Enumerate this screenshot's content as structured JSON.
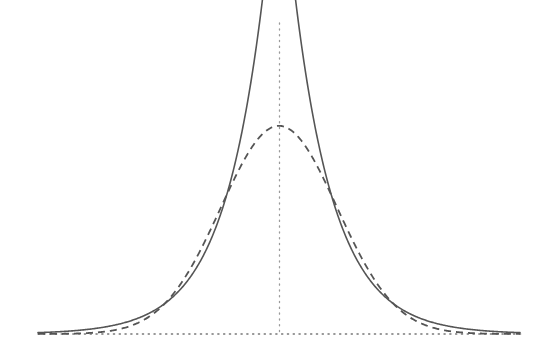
{
  "figure": {
    "title": "",
    "background_color": "#ffffff",
    "width": 554,
    "height": 364
  },
  "chart_data": {
    "type": "line",
    "title": "",
    "subtitle": "",
    "xlabel": "",
    "ylabel": "",
    "xlim": [
      -6,
      6
    ],
    "ylim": [
      0,
      0.58
    ],
    "grid": false,
    "legend_position": "none",
    "annotations": [],
    "axes": {
      "x_axis_style": "dotted",
      "x_axis_color": "#777777",
      "x_axis_y_value": 0,
      "center_line_style": "dotted",
      "center_line_color": "#999999",
      "center_line_x_value": 0,
      "tick_labels_x": [],
      "tick_labels_y": [],
      "ticks_visible": false
    },
    "series": [
      {
        "name": "Laplace density",
        "style": "solid",
        "color": "#555555",
        "line_width": 1.6,
        "peak_x": 0,
        "peak_y": 0.55,
        "scale": 0.9,
        "x": [
          -6.0,
          -5.7,
          -5.4,
          -5.1,
          -4.8,
          -4.5,
          -4.2,
          -3.9,
          -3.6,
          -3.3,
          -3.0,
          -2.7,
          -2.4,
          -2.1,
          -1.8,
          -1.5,
          -1.2,
          -0.9,
          -0.6,
          -0.3,
          0.0,
          0.3,
          0.6,
          0.9,
          1.2,
          1.5,
          1.8,
          2.1,
          2.4,
          2.7,
          3.0,
          3.3,
          3.6,
          3.9,
          4.2,
          4.5,
          4.8,
          5.1,
          5.4,
          5.7,
          6.0
        ],
        "values": [
          0.0014,
          0.0019,
          0.0025,
          0.0034,
          0.0045,
          0.0061,
          0.0082,
          0.011,
          0.0149,
          0.02,
          0.0269,
          0.0362,
          0.0487,
          0.0654,
          0.0879,
          0.1181,
          0.1588,
          0.2134,
          0.2868,
          0.3855,
          0.55,
          0.3855,
          0.2868,
          0.2134,
          0.1588,
          0.1181,
          0.0879,
          0.0654,
          0.0487,
          0.0362,
          0.0269,
          0.02,
          0.0149,
          0.011,
          0.0082,
          0.0061,
          0.0045,
          0.0034,
          0.0025,
          0.0019,
          0.0014
        ]
      },
      {
        "name": "Normal density",
        "style": "dashed",
        "color": "#555555",
        "line_width": 1.8,
        "dash_pattern": "7 5",
        "peak_x": 0,
        "peak_y": 0.305,
        "sigma": 1.45,
        "x": [
          -6.0,
          -5.7,
          -5.4,
          -5.1,
          -4.8,
          -4.5,
          -4.2,
          -3.9,
          -3.6,
          -3.3,
          -3.0,
          -2.7,
          -2.4,
          -2.1,
          -1.8,
          -1.5,
          -1.2,
          -0.9,
          -0.6,
          -0.3,
          0.0,
          0.3,
          0.6,
          0.9,
          1.2,
          1.5,
          1.8,
          2.1,
          2.4,
          2.7,
          3.0,
          3.3,
          3.6,
          3.9,
          4.2,
          4.5,
          4.8,
          5.1,
          5.4,
          5.7,
          6.0
        ],
        "values": [
          0.0007,
          0.0015,
          0.0029,
          0.0054,
          0.0098,
          0.017,
          0.0284,
          0.0458,
          0.071,
          0.106,
          0.1524,
          0.2109,
          0.2809,
          0.3601,
          0.4443,
          0.5278,
          0.6036,
          0.6651,
          0.7075,
          0.7281,
          0.735,
          0.7281,
          0.7075,
          0.6651,
          0.6036,
          0.5278,
          0.4443,
          0.3601,
          0.2809,
          0.2109,
          0.1524,
          0.106,
          0.071,
          0.0458,
          0.0284,
          0.017,
          0.0098,
          0.0054,
          0.0029,
          0.0015,
          0.0007
        ]
      }
    ],
    "crossings": [
      {
        "x": -1.0,
        "note": "inner-left"
      },
      {
        "x": 1.0,
        "note": "inner-right"
      },
      {
        "x": -3.45,
        "note": "outer-left"
      },
      {
        "x": 3.55,
        "note": "outer-right"
      }
    ]
  },
  "geometry": {
    "baseline_y": 334,
    "center_x": 279,
    "left_x": 38,
    "right_x": 520,
    "laplace_peak_y": 58,
    "normal_peak_y": 181,
    "vline_top_y": 23
  }
}
